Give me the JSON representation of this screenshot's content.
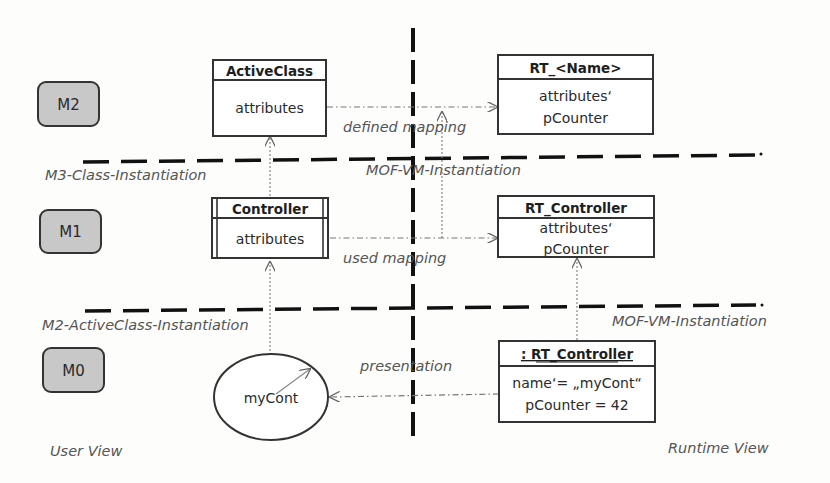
{
  "diagram": {
    "levels": [
      {
        "id": "m2",
        "label": "M2"
      },
      {
        "id": "m1",
        "label": "M1"
      },
      {
        "id": "m0",
        "label": "M0"
      }
    ],
    "separators": {
      "m3_class_instantiation": "M3-Class-Instantiation",
      "mof_vm_instantiation_top": "MOF-VM-Instantiation",
      "m2_activeclass_instantiation": "M2-ActiveClass-Instantiation",
      "mof_vm_instantiation_bottom": "MOF-VM-Instantiation"
    },
    "views": {
      "user_view": "User View",
      "runtime_view": "Runtime View"
    },
    "boxes": {
      "active_class": {
        "title": "ActiveClass",
        "lines": [
          "attributes"
        ]
      },
      "rt_name": {
        "title": "RT_<Name>",
        "lines": [
          "attributes‘",
          "pCounter"
        ]
      },
      "controller": {
        "title": "Controller",
        "lines": [
          "attributes"
        ]
      },
      "rt_controller": {
        "title": "RT_Controller",
        "lines": [
          "attributes‘",
          "pCounter"
        ]
      },
      "rt_controller_instance": {
        "title": ": RT_Controller",
        "lines": [
          "name‘= „myCont“",
          "pCounter = 42"
        ]
      },
      "my_cont": {
        "label": "myCont"
      }
    },
    "mappings": {
      "defined": "defined mapping",
      "used": "used mapping",
      "presentation": "presentation"
    },
    "colors": {
      "level_fill": "#c8c8c8",
      "line": "#1a1a1a",
      "label": "#555555",
      "connector": "#777777"
    }
  }
}
